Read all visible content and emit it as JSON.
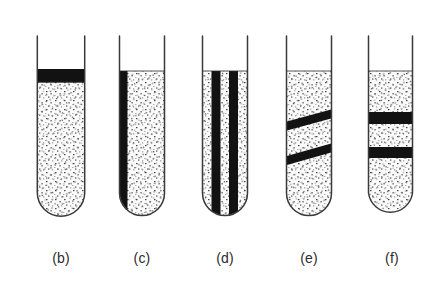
{
  "figure": {
    "kind": "test-tube-diagram",
    "background_color": "#ffffff",
    "glass_outline_color": "#3a3a3a",
    "band_color": "#111111",
    "stipple_color": "#555555",
    "fill_background_color": "#fbfbfb",
    "label_color": "#2b2b2b",
    "tube_count": 5
  },
  "tubes": [
    {
      "id": "tube-b",
      "label": "(b)",
      "x_left": 37,
      "x_right": 85,
      "y_top": 36,
      "y_bottom": 216,
      "fill_top": 82,
      "label_x": 61,
      "label_y": 258,
      "bands": [
        {
          "type": "horizontal",
          "y_top": 69,
          "y_bottom": 82
        }
      ]
    },
    {
      "id": "tube-c",
      "label": "(c)",
      "x_left": 119,
      "x_right": 165,
      "y_top": 36,
      "y_bottom": 216,
      "fill_top": 71,
      "label_x": 142,
      "label_y": 258,
      "bands": [
        {
          "type": "vertical",
          "x_left": 119,
          "x_right": 127,
          "y_top": 71,
          "y_bottom": 207
        }
      ]
    },
    {
      "id": "tube-d",
      "label": "(d)",
      "x_left": 202,
      "x_right": 248,
      "y_top": 36,
      "y_bottom": 216,
      "fill_top": 71,
      "label_x": 225,
      "label_y": 258,
      "bands": [
        {
          "type": "vertical",
          "x_left": 212,
          "x_right": 220,
          "y_top": 71,
          "y_bottom": 212
        },
        {
          "type": "vertical",
          "x_left": 229,
          "x_right": 237,
          "y_top": 71,
          "y_bottom": 212
        }
      ]
    },
    {
      "id": "tube-e",
      "label": "(e)",
      "x_left": 286,
      "x_right": 332,
      "y_top": 36,
      "y_bottom": 216,
      "fill_top": 71,
      "label_x": 309,
      "label_y": 258,
      "bands": [
        {
          "type": "diagonal",
          "y_left": 127,
          "y_right": 114,
          "thickness": 9
        },
        {
          "type": "diagonal",
          "y_left": 161,
          "y_right": 147,
          "thickness": 9
        }
      ]
    },
    {
      "id": "tube-f",
      "label": "(f)",
      "x_left": 368,
      "x_right": 413,
      "y_top": 36,
      "y_bottom": 216,
      "fill_top": 71,
      "label_x": 391,
      "label_y": 258,
      "bands": [
        {
          "type": "horizontal",
          "y_top": 112,
          "y_bottom": 124
        },
        {
          "type": "horizontal",
          "y_top": 147,
          "y_bottom": 158
        }
      ]
    }
  ],
  "labels": {
    "b": "(b)",
    "c": "(c)",
    "d": "(d)",
    "e": "(e)",
    "f": "(f)"
  }
}
